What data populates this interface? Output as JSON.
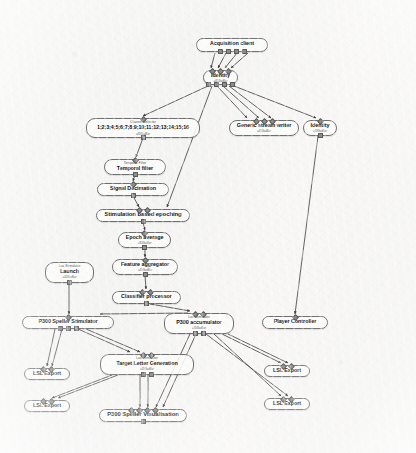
{
  "app": {
    "canvas_name": "scenario-designer-canvas",
    "background_color": "#f5f5f4",
    "node_border_color": "#6f6f6f",
    "link_color": "#3c3c3c"
  },
  "nodes": [
    {
      "id": "acquisition-client",
      "caption": "",
      "title": "Acquisition client",
      "subtitle": "",
      "x": 196,
      "y": 38,
      "w": 72,
      "h": 14,
      "in": 0,
      "out": 4
    },
    {
      "id": "identity-top",
      "caption": "",
      "title": "Identity",
      "subtitle": "=IDGuiBar",
      "x": 203,
      "y": 70,
      "w": 35,
      "h": 15,
      "in": 3,
      "out": 4
    },
    {
      "id": "channel-selector",
      "caption": "Channel Selector",
      "title": "1;2;3;4;5;6;7;8;9;10;11;12;13;14;15;16",
      "subtitle": "=IDGuiBar",
      "x": 86,
      "y": 118,
      "w": 114,
      "h": 20,
      "in": 1,
      "out": 1
    },
    {
      "id": "generic-stream-writer",
      "caption": "",
      "title": "Generic stream writer",
      "subtitle": "=IDGuiBar",
      "x": 229,
      "y": 120,
      "w": 70,
      "h": 16,
      "in": 3,
      "out": 0
    },
    {
      "id": "identity-right",
      "caption": "",
      "title": "Identity",
      "subtitle": "=IDGuiBar",
      "x": 303,
      "y": 120,
      "w": 34,
      "h": 16,
      "in": 1,
      "out": 1
    },
    {
      "id": "temporal-filter",
      "caption": "Temporal Filter",
      "title": "Temporal filter",
      "subtitle": "",
      "x": 104,
      "y": 159,
      "w": 62,
      "h": 16,
      "in": 1,
      "out": 1
    },
    {
      "id": "signal-decimation",
      "caption": "",
      "title": "Signal Decimation",
      "subtitle": "",
      "x": 97,
      "y": 183,
      "w": 72,
      "h": 13,
      "in": 1,
      "out": 1
    },
    {
      "id": "stimulation-based-epoching",
      "caption": "",
      "title": "Stimulation based epoching",
      "subtitle": "",
      "x": 96,
      "y": 209,
      "w": 94,
      "h": 13,
      "in": 2,
      "out": 1
    },
    {
      "id": "epoch-average",
      "caption": "",
      "title": "Epoch average",
      "subtitle": "=IDGuiBar",
      "x": 118,
      "y": 232,
      "w": 53,
      "h": 16,
      "in": 1,
      "out": 1
    },
    {
      "id": "feature-aggregator",
      "caption": "",
      "title": "Feature aggregator",
      "subtitle": "=IDGuiBar",
      "x": 112,
      "y": 259,
      "w": 66,
      "h": 16,
      "in": 1,
      "out": 1
    },
    {
      "id": "classifier-processor",
      "caption": "",
      "title": "Classifier processor",
      "subtitle": "",
      "x": 112,
      "y": 291,
      "w": 69,
      "h": 13,
      "in": 2,
      "out": 1
    },
    {
      "id": "launch",
      "caption": "Lua Stimulator",
      "title": "Launch",
      "subtitle": "=IDGuiBar",
      "x": 45,
      "y": 262,
      "w": 49,
      "h": 21,
      "in": 0,
      "out": 1
    },
    {
      "id": "p300-speller-stimulator",
      "caption": "",
      "title": "P300 Speller Stimulator",
      "subtitle": "",
      "x": 22,
      "y": 316,
      "w": 92,
      "h": 13,
      "in": 1,
      "out": 3
    },
    {
      "id": "p300-accumulator",
      "caption": "Lua Stimulator",
      "title": "P300 accumulator",
      "subtitle": "=IDGuiBar",
      "x": 164,
      "y": 313,
      "w": 70,
      "h": 21,
      "in": 2,
      "out": 2
    },
    {
      "id": "player-controller",
      "caption": "",
      "title": "Player Controller",
      "subtitle": "",
      "x": 262,
      "y": 316,
      "w": 66,
      "h": 13,
      "in": 1,
      "out": 0
    },
    {
      "id": "lsl-export-left-1",
      "caption": "",
      "title": "LSL Export",
      "subtitle": "",
      "x": 24,
      "y": 368,
      "w": 46,
      "h": 12,
      "in": 2,
      "out": 0
    },
    {
      "id": "lsl-export-left-2",
      "caption": "",
      "title": "LSL Export",
      "subtitle": "",
      "x": 24,
      "y": 400,
      "w": 46,
      "h": 12,
      "in": 2,
      "out": 0
    },
    {
      "id": "target-letter-generation",
      "caption": "Lua Stimulator",
      "title": "Target Letter Generation",
      "subtitle": "=IDGuiBar",
      "x": 100,
      "y": 354,
      "w": 94,
      "h": 21,
      "in": 2,
      "out": 2
    },
    {
      "id": "lsl-export-right-1",
      "caption": "",
      "title": "LSL Export",
      "subtitle": "",
      "x": 264,
      "y": 365,
      "w": 46,
      "h": 12,
      "in": 2,
      "out": 0
    },
    {
      "id": "lsl-export-right-2",
      "caption": "",
      "title": "LSL Export",
      "subtitle": "",
      "x": 264,
      "y": 398,
      "w": 46,
      "h": 12,
      "in": 2,
      "out": 0
    },
    {
      "id": "p300-speller-visualisation",
      "caption": "",
      "title": "P300 Speller Visualisation",
      "subtitle": "",
      "x": 99,
      "y": 409,
      "w": 88,
      "h": 13,
      "in": 4,
      "out": 1
    }
  ],
  "links": [
    {
      "from": "acquisition-client",
      "to": "identity-top"
    },
    {
      "from": "identity-top",
      "to": "channel-selector"
    },
    {
      "from": "identity-top",
      "to": "generic-stream-writer"
    },
    {
      "from": "identity-top",
      "to": "identity-right"
    },
    {
      "from": "identity-top",
      "to": "stimulation-based-epoching"
    },
    {
      "from": "channel-selector",
      "to": "temporal-filter"
    },
    {
      "from": "temporal-filter",
      "to": "signal-decimation"
    },
    {
      "from": "signal-decimation",
      "to": "stimulation-based-epoching"
    },
    {
      "from": "stimulation-based-epoching",
      "to": "epoch-average"
    },
    {
      "from": "epoch-average",
      "to": "feature-aggregator"
    },
    {
      "from": "feature-aggregator",
      "to": "classifier-processor"
    },
    {
      "from": "classifier-processor",
      "to": "p300-accumulator"
    },
    {
      "from": "launch",
      "to": "p300-speller-stimulator"
    },
    {
      "from": "identity-right",
      "to": "player-controller"
    },
    {
      "from": "p300-accumulator",
      "to": "p300-speller-stimulator"
    },
    {
      "from": "p300-speller-stimulator",
      "to": "lsl-export-left-1"
    },
    {
      "from": "p300-speller-stimulator",
      "to": "target-letter-generation"
    },
    {
      "from": "p300-speller-stimulator",
      "to": "p300-accumulator"
    },
    {
      "from": "target-letter-generation",
      "to": "lsl-export-left-2"
    },
    {
      "from": "target-letter-generation",
      "to": "p300-speller-visualisation"
    },
    {
      "from": "p300-accumulator",
      "to": "lsl-export-right-1"
    },
    {
      "from": "p300-accumulator",
      "to": "lsl-export-right-2"
    },
    {
      "from": "p300-accumulator",
      "to": "p300-speller-visualisation"
    }
  ]
}
